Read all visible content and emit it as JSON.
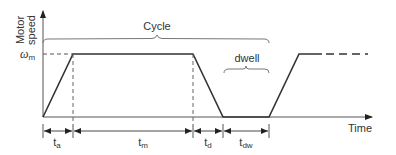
{
  "diagram": {
    "y_axis_label_line1": "Motor",
    "y_axis_label_line2": "speed",
    "x_axis_label": "Time",
    "level_label_symbol": "ω",
    "level_label_sub": "m",
    "cycle_label": "Cycle",
    "dwell_label": "dwell",
    "intervals": [
      {
        "symbol": "t",
        "sub": "a",
        "meaning": "acceleration time"
      },
      {
        "symbol": "t",
        "sub": "m",
        "meaning": "constant speed time"
      },
      {
        "symbol": "t",
        "sub": "d",
        "meaning": "deceleration time"
      },
      {
        "symbol": "t",
        "sub": "dw",
        "meaning": "dwell time"
      }
    ],
    "colors": {
      "profile_line": "#333333",
      "axis_line": "#555555",
      "brace_line": "#777777",
      "text": "#333333"
    }
  }
}
